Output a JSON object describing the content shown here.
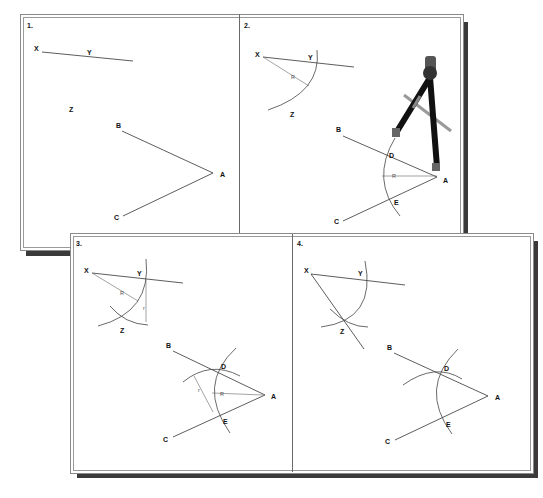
{
  "figure": {
    "colors": {
      "ink": "#333333",
      "frame": "#8a8a8a",
      "shadow": "#3a3a3a",
      "background": "#ffffff"
    }
  },
  "panels": [
    {
      "step": "1.",
      "points": {
        "X": "X",
        "Y": "Y",
        "Z": "Z",
        "A": "A",
        "B": "B",
        "C": "C"
      }
    },
    {
      "step": "2.",
      "points": {
        "X": "X",
        "Y": "Y",
        "Z": "Z",
        "A": "A",
        "B": "B",
        "C": "C",
        "D": "D",
        "E": "E"
      },
      "dimensions": {
        "small_radius": "R",
        "large_radius": "R"
      },
      "illustration": "compass-tool"
    },
    {
      "step": "3.",
      "points": {
        "X": "X",
        "Y": "Y",
        "Z": "Z",
        "A": "A",
        "B": "B",
        "C": "C",
        "D": "D",
        "E": "E"
      },
      "dimensions": {
        "radius_at_X": "R",
        "chord_at_Y": "r",
        "radius_at_A": "R",
        "chord_at_D": "r"
      }
    },
    {
      "step": "4.",
      "points": {
        "X": "X",
        "Y": "Y",
        "Z": "Z",
        "A": "A",
        "B": "B",
        "C": "C",
        "D": "D",
        "E": "E"
      }
    }
  ]
}
